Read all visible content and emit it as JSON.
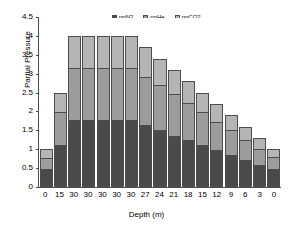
{
  "chart_data": {
    "type": "bar",
    "stacked": true,
    "title": "",
    "xlabel": "Depth (m)",
    "ylabel": "Partial Pressure",
    "categories": [
      "0",
      "15",
      "30",
      "30",
      "30",
      "30",
      "30",
      "27",
      "24",
      "21",
      "18",
      "15",
      "12",
      "9",
      "6",
      "3",
      "0"
    ],
    "ylim": [
      0,
      4.5
    ],
    "ytick_labels": [
      "0",
      "0.5",
      "1",
      "1.5",
      "2",
      "2.5",
      "3",
      "3.5",
      "4",
      "4.5"
    ],
    "ytick_values": [
      0,
      0.5,
      1,
      1.5,
      2,
      2.5,
      3,
      3.5,
      4,
      4.5
    ],
    "grid": false,
    "legend_position": "top-center",
    "series": [
      {
        "name": "ppN2",
        "color": "#4a4a4a",
        "values": [
          0.47,
          1.11,
          1.77,
          1.77,
          1.77,
          1.77,
          1.77,
          1.64,
          1.5,
          1.36,
          1.24,
          1.11,
          0.99,
          0.86,
          0.72,
          0.59,
          0.47
        ]
      },
      {
        "name": "ppHe",
        "color": "#9c9c9c",
        "values": [
          0.31,
          0.88,
          1.38,
          1.38,
          1.38,
          1.38,
          1.38,
          1.28,
          1.19,
          1.09,
          0.98,
          0.88,
          0.74,
          0.64,
          0.53,
          0.42,
          0.33
        ]
      },
      {
        "name": "ppCO2",
        "color": "#b5b5b5",
        "values": [
          0.22,
          0.51,
          0.85,
          0.85,
          0.85,
          0.85,
          0.85,
          0.78,
          0.71,
          0.65,
          0.58,
          0.51,
          0.47,
          0.4,
          0.35,
          0.29,
          0.2
        ]
      }
    ],
    "totals": [
      1.0,
      2.5,
      4.0,
      4.0,
      4.0,
      4.0,
      4.0,
      3.7,
      3.4,
      3.1,
      2.8,
      2.5,
      2.2,
      1.9,
      1.6,
      1.3,
      1.0
    ]
  },
  "legend": {
    "items": [
      {
        "label": "ppN2"
      },
      {
        "label": "ppHe"
      },
      {
        "label": "ppCO2"
      }
    ]
  },
  "axes": {
    "y_title": "Partial Pressure",
    "x_title": "Depth (m)"
  }
}
